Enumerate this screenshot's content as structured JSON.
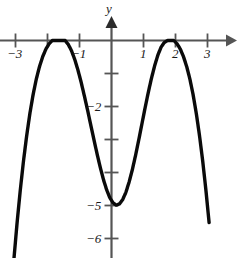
{
  "figure": {
    "background_color": "#ffffff",
    "axis_color": "#555555",
    "curve_color": "#0a0a0a",
    "text_color": "#1a1a1a",
    "y_axis_label": "y"
  },
  "chart_data": {
    "type": "line",
    "title": "",
    "xlabel": "",
    "ylabel": "y",
    "grid": false,
    "legend": null,
    "function": "y = -(x^2 - 4)^2 / 4",
    "xlim": [
      -3.35,
      3.85
    ],
    "ylim": [
      -6.6,
      1.2
    ],
    "x_ticks": [
      -3,
      -1,
      1,
      2,
      3
    ],
    "x_tick_labels": [
      "−3",
      "−1",
      "1",
      "2",
      "3"
    ],
    "x_ticks_unlabeled": [
      -2
    ],
    "y_ticks": [
      -1,
      -2,
      -3,
      -4,
      -5,
      -6
    ],
    "y_tick_labels": [
      "",
      "−2",
      "",
      "",
      "−5",
      "−6"
    ],
    "annotations": [
      {
        "text": "local maximum",
        "x": -2,
        "y": 0
      },
      {
        "text": "local minimum",
        "x": 0,
        "y": -4
      },
      {
        "text": "local maximum",
        "x": 2,
        "y": 0
      }
    ],
    "x": [
      -3.05,
      -2.95,
      -2.85,
      -2.75,
      -2.65,
      -2.55,
      -2.45,
      -2.35,
      -2.25,
      -2.15,
      -2.05,
      -1.95,
      -1.85,
      -1.75,
      -1.65,
      -1.55,
      -1.45,
      -1.35,
      -1.25,
      -1.15,
      -1.05,
      -0.95,
      -0.85,
      -0.75,
      -0.65,
      -0.55,
      -0.45,
      -0.35,
      -0.25,
      -0.15,
      -0.05,
      0.05,
      0.15,
      0.25,
      0.35,
      0.45,
      0.55,
      0.65,
      0.75,
      0.85,
      0.95,
      1.05,
      1.15,
      1.25,
      1.35,
      1.45,
      1.55,
      1.65,
      1.75,
      1.85,
      1.95,
      2.05,
      2.15,
      2.25,
      2.35,
      2.45,
      2.55,
      2.65,
      2.75,
      2.85,
      2.95,
      3.05
    ],
    "y": [
      -6.63,
      -5.52,
      -4.53,
      -3.65,
      -2.88,
      -2.21,
      -1.64,
      -1.17,
      -0.79,
      -0.49,
      -0.26,
      -0.1,
      0.0,
      0.0,
      0.0,
      0.0,
      0.0,
      -0.12,
      -0.31,
      -0.57,
      -0.89,
      -1.26,
      -1.67,
      -2.1,
      -2.55,
      -3.0,
      -3.44,
      -3.85,
      -4.22,
      -4.53,
      -4.77,
      -4.92,
      -4.99,
      -4.95,
      -4.82,
      -4.6,
      -4.29,
      -3.92,
      -3.49,
      -3.02,
      -2.53,
      -2.04,
      -1.57,
      -1.14,
      -0.76,
      -0.44,
      -0.2,
      -0.06,
      0.0,
      0.0,
      0.0,
      -0.1,
      -0.26,
      -0.49,
      -0.79,
      -1.17,
      -1.64,
      -2.21,
      -2.88,
      -3.65,
      -4.53,
      -5.52,
      -6.63
    ]
  }
}
